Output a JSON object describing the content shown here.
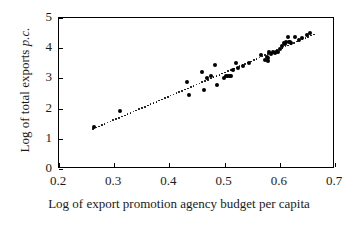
{
  "chart_data": {
    "type": "scatter",
    "title": "",
    "xlabel": "Log of export promotion agency budget per capita",
    "ylabel": "Log of total exports p.c.",
    "ylabel_plain": "Log of total exports ",
    "ylabel_italic": "p.c.",
    "xlim": [
      0.2,
      0.7
    ],
    "ylim": [
      0,
      5
    ],
    "xticks": [
      0.2,
      0.3,
      0.4,
      0.5,
      0.6,
      0.7
    ],
    "xtick_labels": [
      "0.2",
      "0.3",
      "0.4",
      "0.5",
      "0.6",
      "0.7"
    ],
    "yticks": [
      0,
      1,
      2,
      3,
      4,
      5
    ],
    "ytick_labels": [
      "0",
      "1",
      "2",
      "3",
      "4",
      "5"
    ],
    "grid": false,
    "legend": false,
    "marker": "filled-circle",
    "marker_color": "#000000",
    "trendline": {
      "style": "dotted",
      "color": "#000000",
      "x_start": 0.262,
      "x_end": 0.662,
      "y_start": 1.33,
      "y_end": 4.46
    },
    "points": [
      {
        "x": 0.263,
        "y": 1.39
      },
      {
        "x": 0.311,
        "y": 1.92
      },
      {
        "x": 0.432,
        "y": 2.88
      },
      {
        "x": 0.436,
        "y": 2.44
      },
      {
        "x": 0.459,
        "y": 3.21
      },
      {
        "x": 0.462,
        "y": 2.62
      },
      {
        "x": 0.468,
        "y": 3.02
      },
      {
        "x": 0.476,
        "y": 3.08
      },
      {
        "x": 0.482,
        "y": 3.44
      },
      {
        "x": 0.487,
        "y": 2.79
      },
      {
        "x": 0.499,
        "y": 3.02
      },
      {
        "x": 0.503,
        "y": 3.09
      },
      {
        "x": 0.506,
        "y": 3.08
      },
      {
        "x": 0.509,
        "y": 3.09
      },
      {
        "x": 0.512,
        "y": 3.07
      },
      {
        "x": 0.516,
        "y": 3.27
      },
      {
        "x": 0.521,
        "y": 3.52
      },
      {
        "x": 0.524,
        "y": 3.33
      },
      {
        "x": 0.533,
        "y": 3.42
      },
      {
        "x": 0.544,
        "y": 3.52
      },
      {
        "x": 0.566,
        "y": 3.79
      },
      {
        "x": 0.573,
        "y": 3.62
      },
      {
        "x": 0.576,
        "y": 3.71
      },
      {
        "x": 0.578,
        "y": 3.66
      },
      {
        "x": 0.579,
        "y": 3.58
      },
      {
        "x": 0.581,
        "y": 3.86
      },
      {
        "x": 0.584,
        "y": 3.82
      },
      {
        "x": 0.588,
        "y": 3.88
      },
      {
        "x": 0.591,
        "y": 3.84
      },
      {
        "x": 0.594,
        "y": 3.87
      },
      {
        "x": 0.597,
        "y": 3.89
      },
      {
        "x": 0.601,
        "y": 3.97
      },
      {
        "x": 0.604,
        "y": 4.07
      },
      {
        "x": 0.607,
        "y": 4.18
      },
      {
        "x": 0.609,
        "y": 4.13
      },
      {
        "x": 0.612,
        "y": 4.21
      },
      {
        "x": 0.614,
        "y": 4.38
      },
      {
        "x": 0.616,
        "y": 4.19
      },
      {
        "x": 0.618,
        "y": 4.22
      },
      {
        "x": 0.621,
        "y": 4.16
      },
      {
        "x": 0.627,
        "y": 4.38
      },
      {
        "x": 0.634,
        "y": 4.27
      },
      {
        "x": 0.641,
        "y": 4.33
      },
      {
        "x": 0.649,
        "y": 4.45
      },
      {
        "x": 0.655,
        "y": 4.5
      }
    ]
  }
}
